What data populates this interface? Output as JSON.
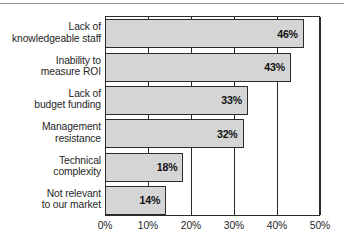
{
  "chart_data": {
    "type": "bar",
    "orientation": "horizontal",
    "title": "",
    "subtitle": "",
    "xlabel": "",
    "ylabel": "",
    "xlim": [
      0,
      50
    ],
    "grid": true,
    "legend": null,
    "categories": [
      "Lack of knowledgeable staff",
      "Inability to measure ROI",
      "Lack of budget funding",
      "Management resistance",
      "Technical complexity",
      "Not relevant to our market"
    ],
    "category_lines": [
      [
        "Lack of",
        "knowledgeable staff"
      ],
      [
        "Inability to",
        "measure ROI"
      ],
      [
        "Lack of",
        "budget funding"
      ],
      [
        "Management",
        "resistance"
      ],
      [
        "Technical",
        "complexity"
      ],
      [
        "Not relevant",
        "to our market"
      ]
    ],
    "values": [
      46,
      43,
      33,
      32,
      18,
      14
    ],
    "value_labels": [
      "46%",
      "43%",
      "33%",
      "32%",
      "18%",
      "14%"
    ],
    "xticks": [
      0,
      10,
      20,
      30,
      40,
      50
    ],
    "xtick_labels": [
      "0%",
      "10%",
      "20%",
      "30%",
      "40%",
      "50%"
    ],
    "colors": {
      "bar_fill": "#d5d5d5",
      "bar_border": "#2b2b2b",
      "axis": "#2b2b2b",
      "text": "#262626",
      "value_text": "#111111",
      "background": "#ffffff",
      "top_rule": "#8f9094"
    }
  }
}
